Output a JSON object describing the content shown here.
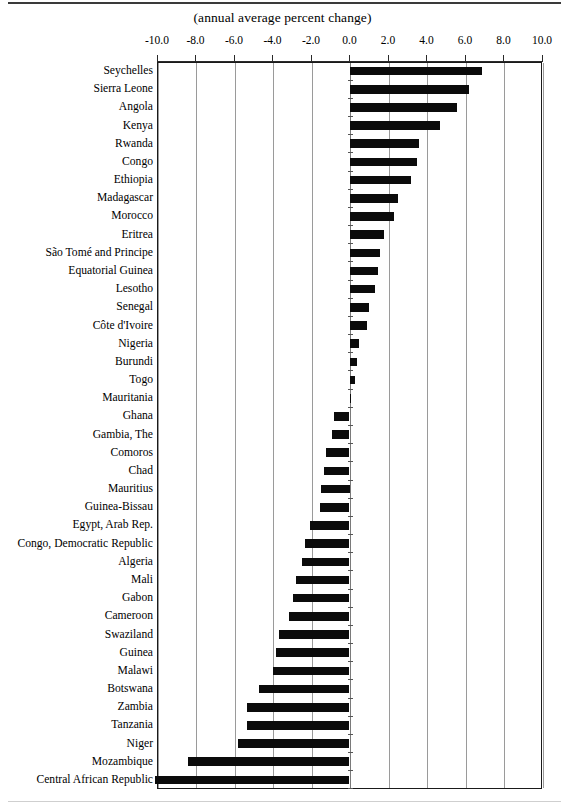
{
  "subtitle": "(annual average percent change)",
  "chart_data": {
    "type": "bar",
    "orientation": "horizontal",
    "title": "",
    "subtitle": "(annual average percent change)",
    "xlabel": "",
    "ylabel": "",
    "xlim": [
      -10.0,
      10.0
    ],
    "xticks": [
      -10.0,
      -8.0,
      -6.0,
      -4.0,
      -2.0,
      0.0,
      2.0,
      4.0,
      6.0,
      8.0,
      10.0
    ],
    "xtick_labels": [
      "-10.0",
      "-8.0",
      "-6.0",
      "-4.0",
      "-2.0",
      "0.0",
      "2.0",
      "4.0",
      "6.0",
      "8.0",
      "10.0"
    ],
    "grid": true,
    "legend": false,
    "bar_color": "#0b0b0b",
    "categories": [
      "Seychelles",
      "Sierra Leone",
      "Angola",
      "Kenya",
      "Rwanda",
      "Congo",
      "Ethiopia",
      "Madagascar",
      "Morocco",
      "Eritrea",
      "São Tomé and Principe",
      "Equatorial Guinea",
      "Lesotho",
      "Senegal",
      "Côte d'Ivoire",
      "Nigeria",
      "Burundi",
      "Togo",
      "Mauritania",
      "Ghana",
      "Gambia, The",
      "Comoros",
      "Chad",
      "Mauritius",
      "Guinea-Bissau",
      "Egypt,  Arab Rep.",
      "Congo, Democratic  Republic",
      "Algeria",
      "Mali",
      "Gabon",
      "Cameroon",
      "Swaziland",
      "Guinea",
      "Malawi",
      "Botswana",
      "Zambia",
      "Tanzania",
      "Niger",
      "Mozambique",
      "Central African Republic"
    ],
    "values": [
      6.9,
      6.2,
      5.6,
      4.7,
      3.6,
      3.5,
      3.2,
      2.5,
      2.3,
      1.8,
      1.6,
      1.5,
      1.3,
      1.0,
      0.9,
      0.5,
      0.4,
      0.3,
      0.1,
      -0.8,
      -0.9,
      -1.2,
      -1.35,
      -1.5,
      -1.55,
      -2.05,
      -2.3,
      -2.45,
      -2.8,
      -2.95,
      -3.15,
      -3.65,
      -3.8,
      -3.95,
      -4.7,
      -5.3,
      -5.3,
      -5.8,
      -8.4,
      -10.1
    ]
  }
}
